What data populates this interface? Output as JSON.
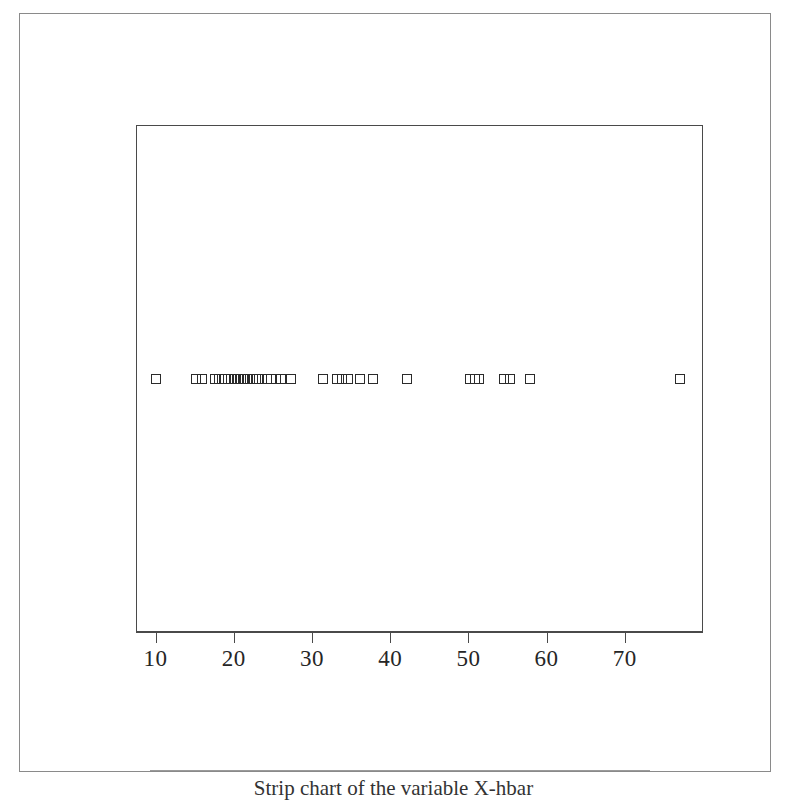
{
  "figure": {
    "kind": "strip-chart",
    "background_color": "#ffffff",
    "frame_color": "#4a4a4a",
    "marker_color": "#2b2b2b",
    "caption": "Strip chart of the variable X-hbar"
  },
  "axis": {
    "tick_labels": [
      "10",
      "20",
      "30",
      "40",
      "50",
      "60",
      "70"
    ],
    "tick_values": [
      10,
      20,
      30,
      40,
      50,
      60,
      70
    ]
  },
  "chart_data": {
    "type": "scatter",
    "title": "",
    "subtitle": "",
    "xlabel": "",
    "ylabel": "",
    "xlim": [
      7.5,
      80
    ],
    "ylim": [
      0,
      1
    ],
    "grid": false,
    "legend": null,
    "marker": "open-square",
    "y_constant": 0.5,
    "x": [
      10.1,
      15.2,
      15.9,
      17.6,
      18.1,
      18.5,
      18.9,
      19.3,
      19.7,
      20.1,
      20.5,
      20.9,
      21.2,
      21.5,
      21.8,
      22.1,
      22.4,
      22.8,
      23.2,
      23.6,
      24.2,
      24.8,
      25.4,
      26.0,
      27.3,
      31.4,
      33.2,
      33.9,
      34.6,
      36.2,
      37.8,
      42.1,
      50.2,
      50.8,
      51.4,
      54.6,
      55.3,
      57.9,
      77.0
    ],
    "n_points": 39
  }
}
